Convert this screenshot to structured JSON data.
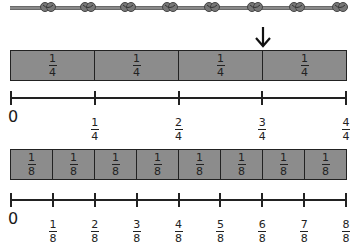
{
  "rope": {
    "knots": 8,
    "knot_positions": [
      48,
      88,
      128,
      170,
      212,
      255,
      297,
      340
    ],
    "color": "#8a8a8a"
  },
  "arrow": {
    "points_to": "3/4"
  },
  "quarters": {
    "segments": [
      {
        "num": "1",
        "den": "4"
      },
      {
        "num": "1",
        "den": "4"
      },
      {
        "num": "1",
        "den": "4"
      },
      {
        "num": "1",
        "den": "4"
      }
    ],
    "line_labels": [
      "0",
      {
        "num": "1",
        "den": "4"
      },
      {
        "num": "2",
        "den": "4"
      },
      {
        "num": "3",
        "den": "4"
      },
      {
        "num": "4",
        "den": "4"
      }
    ]
  },
  "eighths": {
    "segments": [
      {
        "num": "1",
        "den": "8"
      },
      {
        "num": "1",
        "den": "8"
      },
      {
        "num": "1",
        "den": "8"
      },
      {
        "num": "1",
        "den": "8"
      },
      {
        "num": "1",
        "den": "8"
      },
      {
        "num": "1",
        "den": "8"
      },
      {
        "num": "1",
        "den": "8"
      },
      {
        "num": "1",
        "den": "8"
      }
    ],
    "line_labels": [
      "0",
      {
        "num": "1",
        "den": "8"
      },
      {
        "num": "2",
        "den": "8"
      },
      {
        "num": "3",
        "den": "8"
      },
      {
        "num": "4",
        "den": "8"
      },
      {
        "num": "5",
        "den": "8"
      },
      {
        "num": "6",
        "den": "8"
      },
      {
        "num": "7",
        "den": "8"
      },
      {
        "num": "8",
        "den": "8"
      }
    ]
  },
  "colors": {
    "bar_fill": "#8c8c8c",
    "stroke": "#222222"
  }
}
